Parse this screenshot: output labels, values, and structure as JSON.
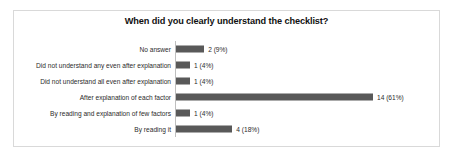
{
  "chart_data": {
    "type": "bar",
    "orientation": "horizontal",
    "title": "When did you clearly understand the checklist?",
    "xlabel": "",
    "ylabel": "",
    "grid": false,
    "legend": false,
    "xlim": [
      0,
      14
    ],
    "categories": [
      "No answer",
      "Did not understand any even after explanation",
      "Did not understand all even after explanation",
      "After explanation of each factor",
      "By reading and explanation of few factors",
      "By reading it"
    ],
    "values": [
      2,
      1,
      1,
      14,
      1,
      4
    ],
    "percents": [
      "9%",
      "4%",
      "4%",
      "61%",
      "4%",
      "18%"
    ],
    "data_labels": [
      "2 (9%)",
      "1 (4%)",
      "1 (4%)",
      "14 (61%)",
      "1 (4%)",
      "4 (18%)"
    ],
    "bar_color": "#595959",
    "axis_color": "#bfbfbf",
    "border_color": "#d9d9d9",
    "background_color": "#ffffff"
  }
}
